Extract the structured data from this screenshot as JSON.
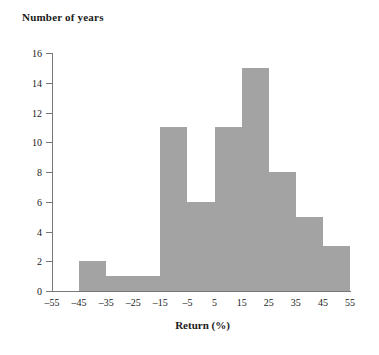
{
  "chart_data": {
    "type": "bar",
    "title": "Number of years",
    "xlabel": "Return (%)",
    "ylabel": "Number of years",
    "grid": false,
    "legend": null,
    "bin_width": 10,
    "xlim": [
      -55,
      55
    ],
    "ylim": [
      0,
      16
    ],
    "xticks": [
      "–55",
      "–45",
      "–35",
      "–25",
      "–15",
      "–5",
      "5",
      "15",
      "25",
      "35",
      "45",
      "55"
    ],
    "xtick_values": [
      -55,
      -45,
      -35,
      -25,
      -15,
      -5,
      5,
      15,
      25,
      35,
      45,
      55
    ],
    "yticks": [
      "0",
      "2",
      "4",
      "6",
      "8",
      "10",
      "12",
      "14",
      "16"
    ],
    "ytick_values": [
      0,
      2,
      4,
      6,
      8,
      10,
      12,
      14,
      16
    ],
    "bar_color": "#a3a3a3",
    "axis_color": "#777777",
    "bins": [
      {
        "range": "–55 to –45",
        "start": -55,
        "end": -45,
        "count": 0
      },
      {
        "range": "–45 to –35",
        "start": -45,
        "end": -35,
        "count": 2
      },
      {
        "range": "–35 to –25",
        "start": -35,
        "end": -25,
        "count": 1
      },
      {
        "range": "–25 to –15",
        "start": -25,
        "end": -15,
        "count": 1
      },
      {
        "range": "–15 to –5",
        "start": -15,
        "end": -5,
        "count": 11
      },
      {
        "range": "–5 to 5",
        "start": -5,
        "end": 5,
        "count": 6
      },
      {
        "range": "5 to 15",
        "start": 5,
        "end": 15,
        "count": 11
      },
      {
        "range": "15 to 25",
        "start": 15,
        "end": 25,
        "count": 15
      },
      {
        "range": "25 to 35",
        "start": 25,
        "end": 35,
        "count": 8
      },
      {
        "range": "35 to 45",
        "start": 35,
        "end": 45,
        "count": 5
      },
      {
        "range": "45 to 55",
        "start": 45,
        "end": 55,
        "count": 3
      }
    ],
    "categories": [
      "–55 to –45",
      "–45 to –35",
      "–35 to –25",
      "–25 to –15",
      "–15 to –5",
      "–5 to 5",
      "5 to 15",
      "15 to 25",
      "25 to 35",
      "35 to 45",
      "45 to 55"
    ],
    "values": [
      0,
      2,
      1,
      1,
      11,
      6,
      11,
      15,
      8,
      5,
      3
    ]
  }
}
